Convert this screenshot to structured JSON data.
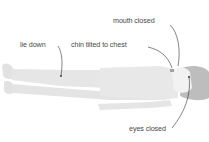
{
  "diagram": {
    "labels": {
      "mouth": "mouth closed",
      "lie": "lie down",
      "chin": "chin tilted to chest",
      "eyes": "eyes closed"
    },
    "colors": {
      "body": "#e6e6e6",
      "body_edge": "#d6d6d6",
      "hair": "#bdbdbd",
      "face": "#f2f2f2",
      "leader": "#333333",
      "text": "#4a4a4a"
    }
  }
}
